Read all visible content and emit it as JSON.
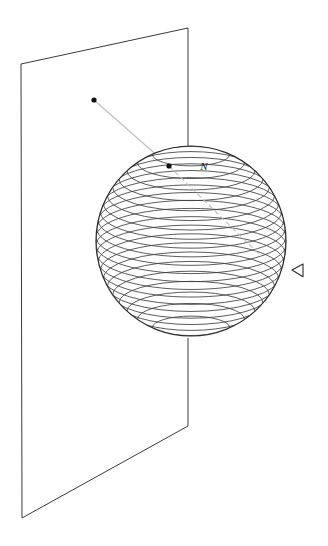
{
  "figure": {
    "background_color": "#ffffff",
    "width": 328,
    "height": 546,
    "line_color": "#2b2b2b",
    "ray_color": "#b9b9b9",
    "dot_color": "#111111"
  },
  "plane": {
    "name": "projection-plane",
    "stroke": "#3a3a3a",
    "stroke_width": 1,
    "corners": {
      "top_left": [
        21,
        64
      ],
      "top_right": [
        188,
        28
      ],
      "bottom_right": [
        188,
        426
      ],
      "bottom_left": [
        22,
        518
      ]
    },
    "right_edge_occluded_from_y": 146,
    "right_edge_occluded_to_y": 338
  },
  "sphere": {
    "name": "sphere",
    "center": [
      191,
      241
    ],
    "radius": 95,
    "outline_stroke": "#2b2b2b",
    "latitude_stroke": "#3d3d3d",
    "latitude_count": 22,
    "latitude_note": "horizontal latitude circles drawn as ellipses, evenly spaced in screen height"
  },
  "labels": {
    "north_pole": {
      "text": "N",
      "x": 204,
      "y": 170
    }
  },
  "points": [
    {
      "name": "plane-point",
      "label": "",
      "x": 94,
      "y": 100,
      "radius": 2.6
    },
    {
      "name": "sphere-point",
      "label": "",
      "x": 169,
      "y": 166,
      "radius": 2.6
    }
  ],
  "ray": {
    "name": "projection-ray",
    "solid_from": [
      94,
      100
    ],
    "solid_to": [
      169,
      166
    ],
    "dashed_from": [
      169,
      166
    ],
    "dashed_to": [
      262,
      257
    ],
    "stroke": "#bdbdbd",
    "dash_pattern": "5 3"
  },
  "axis_arrow": {
    "name": "axis-arrowhead",
    "direction": "left",
    "tip": [
      292,
      270
    ],
    "x": 292,
    "y": 270,
    "size": 11,
    "stroke": "#2b2b2b"
  }
}
